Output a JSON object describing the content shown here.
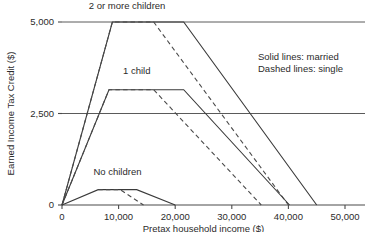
{
  "chart_data": {
    "type": "line",
    "title": "",
    "xlabel": "Pretax household income ($)",
    "ylabel": "Earned Income Tax Credit ($)",
    "xlim": [
      0,
      50000
    ],
    "ylim": [
      0,
      5000
    ],
    "grid": true,
    "xticks": [
      0,
      10000,
      20000,
      30000,
      40000,
      50000
    ],
    "xticklabels": [
      "0",
      "10,000",
      "20,000",
      "30,000",
      "40,000",
      "50,000"
    ],
    "yticks": [
      0,
      2500,
      5000
    ],
    "yticklabels": [
      "0",
      "2,500",
      "5,000"
    ],
    "legend_position": "upper-right-inside",
    "legend_entries": [
      "Solid lines: married",
      "Dashed lines: single"
    ],
    "annotations": [
      {
        "text": "2 or more children",
        "x": 11500,
        "y": 5450
      },
      {
        "text": "1 child",
        "x": 13200,
        "y": 3680
      },
      {
        "text": "No children",
        "x": 9800,
        "y": 900
      }
    ],
    "series": [
      {
        "name": "2 or more children, married",
        "style": "solid",
        "filing_status": "married",
        "children": "2 or more",
        "points": [
          [
            0,
            0
          ],
          [
            8900,
            5000
          ],
          [
            21500,
            5000
          ],
          [
            45000,
            0
          ]
        ]
      },
      {
        "name": "2 or more children, single",
        "style": "dashed",
        "filing_status": "single",
        "children": "2 or more",
        "points": [
          [
            0,
            0
          ],
          [
            8900,
            5000
          ],
          [
            16200,
            5000
          ],
          [
            40000,
            0
          ]
        ]
      },
      {
        "name": "1 child, married",
        "style": "solid",
        "filing_status": "married",
        "children": "1",
        "points": [
          [
            0,
            0
          ],
          [
            8300,
            3150
          ],
          [
            21500,
            3150
          ],
          [
            40200,
            0
          ]
        ]
      },
      {
        "name": "1 child, single",
        "style": "dashed",
        "filing_status": "single",
        "children": "1",
        "points": [
          [
            0,
            0
          ],
          [
            8300,
            3150
          ],
          [
            16200,
            3150
          ],
          [
            35200,
            0
          ]
        ]
      },
      {
        "name": "No children, married",
        "style": "solid",
        "filing_status": "married",
        "children": "0",
        "points": [
          [
            0,
            0
          ],
          [
            6400,
            420
          ],
          [
            13200,
            420
          ],
          [
            20000,
            0
          ]
        ]
      },
      {
        "name": "No children, single",
        "style": "dashed",
        "filing_status": "single",
        "children": "0",
        "points": [
          [
            6400,
            420
          ],
          [
            10300,
            420
          ],
          [
            14400,
            0
          ]
        ]
      }
    ]
  }
}
